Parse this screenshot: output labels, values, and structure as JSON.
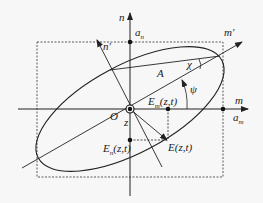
{
  "diagram": {
    "labels": {
      "n_axis": "n",
      "m_axis": "m",
      "n_prime": "n'",
      "m_prime": "m'",
      "a_n": "a",
      "a_n_sub": "n",
      "a_m": "a",
      "a_m_sub": "m",
      "origin": "O",
      "z": "z",
      "A": "A",
      "chi": "χ",
      "psi": "ψ",
      "E_m": "E",
      "E_m_sub": "m",
      "E_m_arg": "(z,t)",
      "E_n": "E",
      "E_n_sub": "n",
      "E_n_arg": "(z,t)",
      "E": "E(z,t)"
    },
    "colors": {
      "line": "#222222",
      "background": "#f7f7f7"
    }
  }
}
